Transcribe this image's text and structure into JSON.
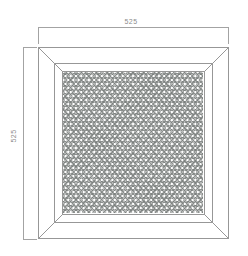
{
  "drawing": {
    "dimensions": {
      "top": {
        "label": "525"
      },
      "left": {
        "label": "525"
      }
    },
    "colors": {
      "background": "#ffffff",
      "line": "#979797",
      "dim_line": "#a3a3a3",
      "text": "#8c8c8c",
      "lattice_base": "#b5b7b6",
      "lattice_line": "#757a78",
      "lattice_dot": "#ffffff"
    }
  }
}
